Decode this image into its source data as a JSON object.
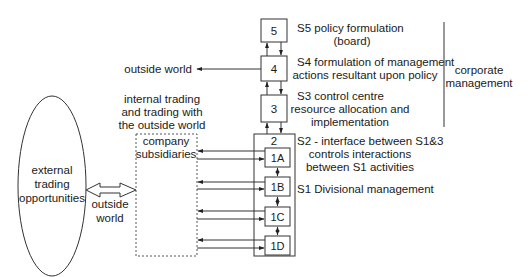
{
  "diagram": {
    "ellipse": {
      "lines": [
        "external",
        "trading",
        "opportunities"
      ]
    },
    "outside_world_bottom": {
      "lines": [
        "outside",
        "world"
      ]
    },
    "outside_world_top": {
      "label": "outside world"
    },
    "internal_trading": {
      "lines": [
        "internal trading",
        "and trading with",
        "the outside world"
      ]
    },
    "subsidiaries": {
      "lines": [
        "company",
        "subsidiaries"
      ]
    },
    "systems": {
      "s5": {
        "number": "5",
        "lines": [
          "S5 policy formulation",
          "(board)"
        ]
      },
      "s4": {
        "number": "4",
        "lines": [
          "S4 formulation of management",
          "actions resultant upon policy"
        ]
      },
      "s3": {
        "number": "3",
        "lines": [
          "S3 control centre",
          "resource allocation and",
          "implementation"
        ]
      },
      "s2": {
        "number": "2",
        "lines": [
          "S2 - interface between S1&3",
          "controls interactions",
          "between S1 activities"
        ]
      },
      "s1": {
        "label": "S1 Divisional management"
      }
    },
    "divisions": [
      "1A",
      "1B",
      "1C",
      "1D"
    ],
    "corporate": {
      "lines": [
        "corporate",
        "management"
      ]
    }
  }
}
